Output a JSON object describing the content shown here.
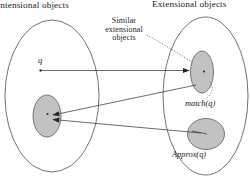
{
  "figure": {
    "titles": {
      "left": "Intensional objects",
      "right": "Extensional objects"
    },
    "annotations": {
      "similar_line1": "Similar",
      "similar_line2": "extensional",
      "similar_line3": "objects",
      "query_point": "q",
      "match_label": "match(q)",
      "approx_label": "Approx(q)"
    },
    "colors": {
      "blob_fill": "#b9b9b9",
      "outline": "#5a5a5a",
      "connector": "#3a3a3a",
      "dotted": "#6d6d6d",
      "background": "#ffffff"
    }
  }
}
